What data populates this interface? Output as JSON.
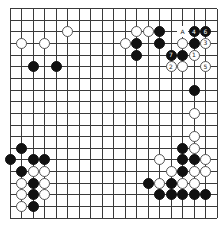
{
  "board": {
    "size": 19,
    "origin_x": 10,
    "origin_y": 8.5,
    "spacing_x": 11.5,
    "spacing_y": 11.65,
    "line_color": "#3a3a3a"
  },
  "stones": [
    {
      "color": "white",
      "col": 5,
      "row": 2,
      "label": ""
    },
    {
      "color": "white",
      "col": 1,
      "row": 3,
      "label": ""
    },
    {
      "color": "white",
      "col": 3,
      "row": 3,
      "label": ""
    },
    {
      "color": "black",
      "col": 2,
      "row": 5,
      "label": ""
    },
    {
      "color": "black",
      "col": 4,
      "row": 5,
      "label": ""
    },
    {
      "color": "white",
      "col": 11,
      "row": 2,
      "label": ""
    },
    {
      "color": "white",
      "col": 12,
      "row": 2,
      "label": ""
    },
    {
      "color": "black",
      "col": 13,
      "row": 2,
      "label": ""
    },
    {
      "color": "black",
      "col": 16,
      "row": 2,
      "label": "4"
    },
    {
      "color": "black",
      "col": 17,
      "row": 2,
      "label": "6"
    },
    {
      "color": "white",
      "col": 10,
      "row": 3,
      "label": ""
    },
    {
      "color": "black",
      "col": 11,
      "row": 3,
      "label": ""
    },
    {
      "color": "black",
      "col": 13,
      "row": 3,
      "label": ""
    },
    {
      "color": "white",
      "col": 15,
      "row": 3,
      "label": ""
    },
    {
      "color": "black",
      "col": 16,
      "row": 3,
      "label": ""
    },
    {
      "color": "white",
      "col": 17,
      "row": 3,
      "label": "3"
    },
    {
      "color": "black",
      "col": 11,
      "row": 4,
      "label": ""
    },
    {
      "color": "black",
      "col": 14,
      "row": 4,
      "label": "7"
    },
    {
      "color": "black",
      "col": 15,
      "row": 4,
      "label": ""
    },
    {
      "color": "white",
      "col": 16,
      "row": 4,
      "label": "1"
    },
    {
      "color": "white",
      "col": 14,
      "row": 5,
      "label": "2"
    },
    {
      "color": "white",
      "col": 15,
      "row": 5,
      "label": ""
    },
    {
      "color": "white",
      "col": 17,
      "row": 5,
      "label": "5"
    },
    {
      "color": "black",
      "col": 16,
      "row": 7,
      "label": ""
    },
    {
      "color": "white",
      "col": 16,
      "row": 9,
      "label": ""
    },
    {
      "color": "white",
      "col": 16,
      "row": 11,
      "label": ""
    },
    {
      "color": "black",
      "col": 15,
      "row": 12,
      "label": ""
    },
    {
      "color": "white",
      "col": 16,
      "row": 12,
      "label": ""
    },
    {
      "color": "white",
      "col": 13,
      "row": 13,
      "label": ""
    },
    {
      "color": "black",
      "col": 15,
      "row": 13,
      "label": ""
    },
    {
      "color": "black",
      "col": 16,
      "row": 13,
      "label": ""
    },
    {
      "color": "white",
      "col": 17,
      "row": 13,
      "label": ""
    },
    {
      "color": "white",
      "col": 14,
      "row": 14,
      "label": ""
    },
    {
      "color": "black",
      "col": 15,
      "row": 14,
      "label": ""
    },
    {
      "color": "white",
      "col": 16,
      "row": 14,
      "label": ""
    },
    {
      "color": "white",
      "col": 17,
      "row": 14,
      "label": ""
    },
    {
      "color": "black",
      "col": 12,
      "row": 15,
      "label": ""
    },
    {
      "color": "white",
      "col": 13,
      "row": 15,
      "label": ""
    },
    {
      "color": "black",
      "col": 14,
      "row": 15,
      "label": ""
    },
    {
      "color": "white",
      "col": 15,
      "row": 15,
      "label": ""
    },
    {
      "color": "white",
      "col": 16,
      "row": 15,
      "label": ""
    },
    {
      "color": "black",
      "col": 13,
      "row": 16,
      "label": ""
    },
    {
      "color": "black",
      "col": 14,
      "row": 16,
      "label": ""
    },
    {
      "color": "black",
      "col": 15,
      "row": 16,
      "label": ""
    },
    {
      "color": "black",
      "col": 16,
      "row": 16,
      "label": ""
    },
    {
      "color": "black",
      "col": 17,
      "row": 16,
      "label": ""
    },
    {
      "color": "black",
      "col": 1,
      "row": 12,
      "label": ""
    },
    {
      "color": "black",
      "col": 0,
      "row": 13,
      "label": ""
    },
    {
      "color": "black",
      "col": 2,
      "row": 13,
      "label": ""
    },
    {
      "color": "black",
      "col": 3,
      "row": 13,
      "label": ""
    },
    {
      "color": "black",
      "col": 1,
      "row": 14,
      "label": ""
    },
    {
      "color": "white",
      "col": 2,
      "row": 14,
      "label": ""
    },
    {
      "color": "white",
      "col": 3,
      "row": 14,
      "label": ""
    },
    {
      "color": "white",
      "col": 1,
      "row": 15,
      "label": ""
    },
    {
      "color": "black",
      "col": 2,
      "row": 15,
      "label": ""
    },
    {
      "color": "white",
      "col": 3,
      "row": 15,
      "label": ""
    },
    {
      "color": "white",
      "col": 1,
      "row": 16,
      "label": ""
    },
    {
      "color": "black",
      "col": 2,
      "row": 16,
      "label": ""
    },
    {
      "color": "white",
      "col": 3,
      "row": 16,
      "label": ""
    },
    {
      "color": "white",
      "col": 1,
      "row": 17,
      "label": ""
    },
    {
      "color": "black",
      "col": 2,
      "row": 17,
      "label": ""
    }
  ],
  "marks": [
    {
      "text": "A",
      "col": 15,
      "row": 2
    }
  ]
}
